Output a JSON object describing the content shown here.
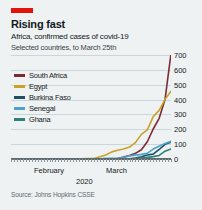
{
  "header": {
    "kicker_color": "#e3120b",
    "title": "Rising fast",
    "subtitle": "Africa, confirmed cases of covid-19",
    "subtitle2": "Selected countries, to March 25th"
  },
  "source": "Source: Johns Hopkins CSSE",
  "chart_data": {
    "type": "line",
    "title": "Rising fast",
    "subtitle": "Africa, confirmed cases of covid-19",
    "note": "Selected countries, to March 25th",
    "xlabel": "2020",
    "ylabel": "",
    "ylim": [
      0,
      700
    ],
    "yticks": [
      0,
      100,
      200,
      300,
      400,
      500,
      600,
      700
    ],
    "ytick_labels": [
      "0",
      "100",
      "200",
      "300",
      "400",
      "500",
      "600",
      "700"
    ],
    "xticks": [
      "February",
      "March"
    ],
    "xtick_labels": [
      "February",
      "March"
    ],
    "x_axis_title": "2020",
    "grid": true,
    "legend_position": "inside-top-left",
    "x": [
      "Feb 1",
      "Feb 3",
      "Feb 5",
      "Feb 7",
      "Feb 9",
      "Feb 11",
      "Feb 13",
      "Feb 15",
      "Feb 17",
      "Feb 19",
      "Feb 21",
      "Feb 23",
      "Feb 25",
      "Feb 27",
      "Feb 29",
      "Mar 2",
      "Mar 4",
      "Mar 6",
      "Mar 8",
      "Mar 10",
      "Mar 12",
      "Mar 14",
      "Mar 16",
      "Mar 18",
      "Mar 20",
      "Mar 22",
      "Mar 24",
      "Mar 25"
    ],
    "series": [
      {
        "name": "South Africa",
        "color": "#7a2b35",
        "values": [
          0,
          0,
          0,
          0,
          0,
          0,
          0,
          0,
          0,
          0,
          0,
          0,
          0,
          0,
          0,
          1,
          1,
          1,
          3,
          13,
          24,
          38,
          62,
          116,
          202,
          274,
          402,
          709
        ]
      },
      {
        "name": "Egypt",
        "color": "#c9a227",
        "values": [
          1,
          1,
          1,
          1,
          1,
          1,
          1,
          1,
          1,
          1,
          1,
          1,
          2,
          3,
          3,
          15,
          27,
          48,
          59,
          67,
          80,
          110,
          166,
          196,
          285,
          327,
          402,
          456
        ]
      },
      {
        "name": "Burkina Faso",
        "color": "#1f4e66",
        "values": [
          0,
          0,
          0,
          0,
          0,
          0,
          0,
          0,
          0,
          0,
          0,
          0,
          0,
          0,
          0,
          0,
          0,
          0,
          0,
          2,
          2,
          7,
          15,
          27,
          33,
          64,
          99,
          114
        ]
      },
      {
        "name": "Senegal",
        "color": "#4da3c7",
        "values": [
          0,
          0,
          0,
          0,
          0,
          0,
          0,
          0,
          0,
          0,
          0,
          0,
          0,
          0,
          1,
          1,
          4,
          4,
          5,
          10,
          21,
          26,
          31,
          38,
          67,
          86,
          105,
          119
        ]
      },
      {
        "name": "Ghana",
        "color": "#2e7f7b",
        "values": [
          0,
          0,
          0,
          0,
          0,
          0,
          0,
          0,
          0,
          0,
          0,
          0,
          0,
          0,
          0,
          0,
          0,
          0,
          0,
          0,
          2,
          3,
          6,
          11,
          16,
          24,
          53,
          68
        ]
      }
    ]
  },
  "legend": [
    {
      "label": "South Africa",
      "color": "#7a2b35"
    },
    {
      "label": "Egypt",
      "color": "#c9a227"
    },
    {
      "label": "Burkina Faso",
      "color": "#1f4e66"
    },
    {
      "label": "Senegal",
      "color": "#4da3c7"
    },
    {
      "label": "Ghana",
      "color": "#2e7f7b"
    }
  ]
}
